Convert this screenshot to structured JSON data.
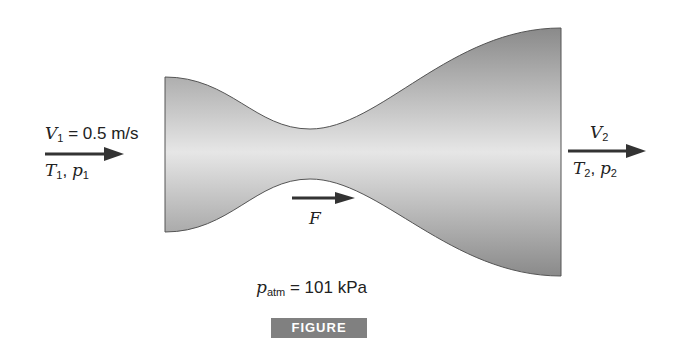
{
  "figure": {
    "caption": "FIGURE P5.2.9",
    "inlet": {
      "velocity_symbol": "V",
      "velocity_sub": "1",
      "velocity_value": "= 0.5 m/s",
      "temp_symbol": "T",
      "temp_sub": "1",
      "sep": ", ",
      "pressure_symbol": "p",
      "pressure_sub": "1"
    },
    "outlet": {
      "velocity_symbol": "V",
      "velocity_sub": "2",
      "temp_symbol": "T",
      "temp_sub": "2",
      "sep": ", ",
      "pressure_symbol": "p",
      "pressure_sub": "2"
    },
    "force_label": "F",
    "atm": {
      "symbol": "p",
      "sub": "atm",
      "value": "= 101 kPa"
    },
    "colors": {
      "nozzle_edge": "#555555",
      "nozzle_dark": "#8a8a8a",
      "nozzle_light": "#e6e6e6",
      "arrow": "#333333",
      "caption_bg": "#808080"
    }
  }
}
